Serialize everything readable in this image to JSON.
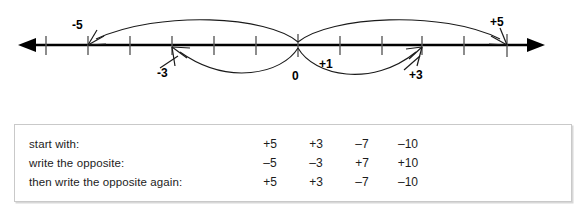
{
  "figure": {
    "number_line": {
      "axis_color": "#000000",
      "left_arrow_x": 18,
      "right_arrow_x": 545,
      "baseline_y": 45,
      "tick_positions_px": [
        46,
        88,
        130,
        172,
        214,
        256,
        298,
        340,
        382,
        422,
        464,
        507
      ],
      "zero_tick_px": 298,
      "tick_spacing_px": 42
    },
    "labels": [
      {
        "id": "minus-five",
        "text": "-5",
        "x": 75,
        "y": 22
      },
      {
        "id": "minus-three",
        "text": "-3",
        "x": 160,
        "y": 68
      },
      {
        "id": "zero",
        "text": "0",
        "x": 293,
        "y": 72
      },
      {
        "id": "plus-one",
        "text": "+1",
        "x": 320,
        "y": 60
      },
      {
        "id": "plus-three",
        "text": "+3",
        "x": 411,
        "y": 70
      },
      {
        "id": "plus-five",
        "text": "+5",
        "x": 492,
        "y": 19
      }
    ],
    "arcs": [
      {
        "id": "arc-zero-to-minus-five",
        "from": 298,
        "to": 88,
        "side": "above"
      },
      {
        "id": "arc-zero-to-plus-five",
        "from": 298,
        "to": 507,
        "side": "above"
      },
      {
        "id": "arc-zero-to-minus-three",
        "from": 298,
        "to": 172,
        "side": "below"
      },
      {
        "id": "arc-zero-to-plus-three",
        "from": 298,
        "to": 422,
        "side": "below"
      }
    ]
  },
  "table": {
    "border_color": "#c9c9c9",
    "rows": [
      {
        "label": "start with:",
        "values": [
          "+5",
          "+3",
          "–7",
          "–10"
        ]
      },
      {
        "label": "write the opposite:",
        "values": [
          "–5",
          "–3",
          "+7",
          "+10"
        ]
      },
      {
        "label": "then write the opposite again:",
        "values": [
          "+5",
          "+3",
          "–7",
          "–10"
        ]
      }
    ]
  }
}
